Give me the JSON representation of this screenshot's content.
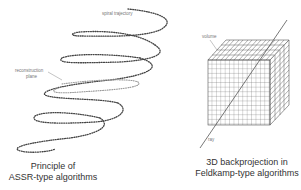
{
  "diagram": {
    "left_panel": {
      "labels": {
        "spiral_trajectory": "spiral trajectory",
        "reconstruction_plane_line1": "reconstruction",
        "reconstruction_plane_line2": "plane"
      },
      "caption": {
        "line1": "Principle of",
        "line2": "ASSR-type algorithms"
      }
    },
    "right_panel": {
      "labels": {
        "volume": "volume",
        "ray": "ray"
      },
      "caption": {
        "line1": "3D backprojection in",
        "line2": "Feldkamp-type algorithms"
      }
    },
    "colors": {
      "spiral": "#444444",
      "plane": "#999999",
      "grid": "#555555",
      "ray": "#555555",
      "text": "#333333"
    }
  }
}
